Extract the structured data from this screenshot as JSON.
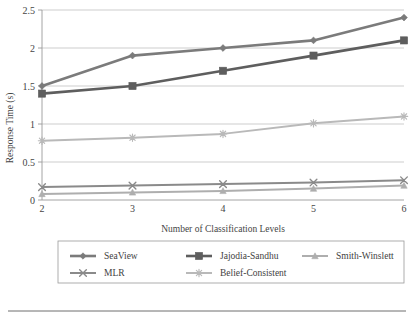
{
  "chart_data": {
    "type": "line",
    "title": "",
    "xlabel": "Number of Classification Levels",
    "ylabel": "Response Time (s)",
    "x": [
      2,
      3,
      4,
      5,
      6
    ],
    "xtick_labels": [
      "2",
      "3",
      "4",
      "5",
      "6"
    ],
    "ytick_labels": [
      "0",
      "0.5",
      "1",
      "1.5",
      "2",
      "2.5"
    ],
    "ytick_values": [
      0,
      0.5,
      1,
      1.5,
      2,
      2.5
    ],
    "xlim": [
      2,
      6
    ],
    "ylim": [
      0,
      2.5
    ],
    "grid": "horizontal",
    "legend_position": "bottom",
    "series": [
      {
        "name": "SeaView",
        "marker": "diamond",
        "color": "#7b7b7b",
        "values": [
          1.5,
          1.9,
          2.0,
          2.1,
          2.4
        ]
      },
      {
        "name": "Jajodia-Sandhu",
        "marker": "square",
        "color": "#5e5e5e",
        "values": [
          1.4,
          1.5,
          1.7,
          1.9,
          2.1
        ]
      },
      {
        "name": "Smith-Winslett",
        "marker": "triangle",
        "color": "#aeaeae",
        "values": [
          0.08,
          0.1,
          0.12,
          0.15,
          0.19
        ]
      },
      {
        "name": "MLR",
        "marker": "x",
        "color": "#8a8a8a",
        "values": [
          0.17,
          0.19,
          0.21,
          0.23,
          0.26
        ]
      },
      {
        "name": "Belief-Consistent",
        "marker": "asterisk",
        "color": "#b9b9b9",
        "values": [
          0.78,
          0.82,
          0.87,
          1.01,
          1.1
        ]
      }
    ]
  },
  "legend": {
    "entries": [
      {
        "label": "SeaView"
      },
      {
        "label": "Jajodia-Sandhu"
      },
      {
        "label": "Smith-Winslett"
      },
      {
        "label": "MLR"
      },
      {
        "label": "Belief-Consistent"
      }
    ]
  }
}
